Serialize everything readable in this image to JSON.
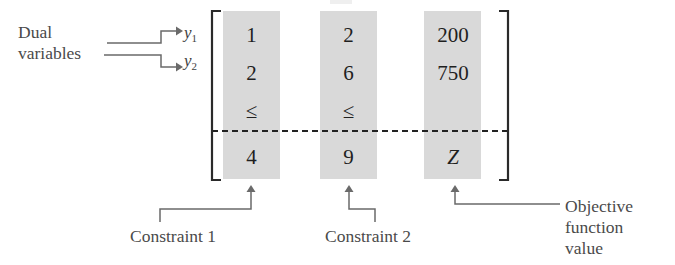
{
  "figure": {
    "kind": "dual-problem-matrix-tableau",
    "dashed_separator": true,
    "colors": {
      "cell_fill": "#d9d9d9",
      "bracket": "#2a2a2a",
      "connector": "#6a6a6a",
      "label_text": "#4a4a4a",
      "cell_text": "#1f1f1f"
    }
  },
  "annotations": {
    "dual_variables_label": "Dual\nvariables",
    "dual_variable_1": "y",
    "dual_variable_1_sub": "1",
    "dual_variable_2": "y",
    "dual_variable_2_sub": "2",
    "constraint_1_label": "Constraint 1",
    "constraint_2_label": "Constraint 2",
    "objective_label": "Objective\nfunction\nvalue"
  },
  "matrix": {
    "columns": [
      {
        "name": "constraint-1",
        "cells": [
          "1",
          "2",
          "≤",
          "4"
        ]
      },
      {
        "name": "constraint-2",
        "cells": [
          "2",
          "6",
          "≤",
          "9"
        ]
      },
      {
        "name": "rhs-objective",
        "cells": [
          "200",
          "750",
          "",
          "Z"
        ]
      }
    ],
    "row_labels": [
      "y1-coefficients",
      "y2-coefficients",
      "inequality",
      "bound"
    ]
  }
}
